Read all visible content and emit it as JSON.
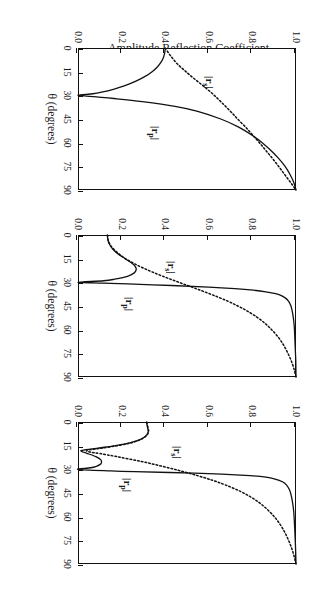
{
  "figure": {
    "yaxis_label": "Amplitude Reflection Coefficient",
    "xaxis_label": "θ (degrees)",
    "rp_label": "|r",
    "rp_sub": "p",
    "rp_label_end": "|",
    "rs_label": "|r",
    "rs_sub": "s",
    "rs_label_end": "|"
  },
  "axes": {
    "x_ticks": [
      "0",
      "15",
      "30",
      "45",
      "60",
      "75",
      "90"
    ],
    "y_ticks": [
      "0.0",
      "0.2",
      "0.4",
      "0.6",
      "0.8",
      "1.0"
    ]
  },
  "panels": [
    {
      "id": "a",
      "label": "(a)  Air Gap = 100 nm",
      "gap_nm": 100
    },
    {
      "id": "b",
      "label": "(b)  Air Gap = 300 nm",
      "gap_nm": 300
    },
    {
      "id": "c",
      "label": "(c)  Air Gap = 400 nm",
      "gap_nm": 400
    }
  ],
  "chart_data": {
    "type": "line",
    "title": "",
    "xlabel": "θ (degrees)",
    "ylabel": "Amplitude Reflection Coefficient",
    "xlim": [
      0,
      90
    ],
    "ylim": [
      0.0,
      1.0
    ],
    "xticks": [
      0,
      15,
      30,
      45,
      60,
      75,
      90
    ],
    "yticks": [
      0.0,
      0.2,
      0.4,
      0.6,
      0.8,
      1.0
    ],
    "grid": false,
    "legend": "inline-annotations",
    "panels": [
      {
        "panel": "a",
        "annotation": "(a)  Air Gap = 100 nm",
        "series": [
          {
            "name": "|r_p|",
            "style": "solid",
            "x": [
              0,
              3,
              6,
              9,
              12,
              15,
              18,
              21,
              24,
              26,
              28,
              29,
              30,
              31,
              32,
              34,
              37,
              40,
              45,
              50,
              55,
              60,
              65,
              70,
              75,
              80,
              85,
              90
            ],
            "values": [
              0.4,
              0.398,
              0.392,
              0.381,
              0.364,
              0.34,
              0.308,
              0.266,
              0.212,
              0.166,
              0.108,
              0.068,
              0.0,
              0.085,
              0.165,
              0.295,
              0.445,
              0.545,
              0.655,
              0.735,
              0.795,
              0.845,
              0.885,
              0.92,
              0.95,
              0.972,
              0.989,
              1.0
            ]
          },
          {
            "name": "|r_s|",
            "style": "dotted",
            "x": [
              0,
              5,
              10,
              14,
              18,
              22,
              26,
              30,
              34,
              38,
              42,
              45,
              50,
              55,
              60,
              65,
              70,
              75,
              80,
              85,
              90
            ],
            "values": [
              0.4,
              0.425,
              0.455,
              0.487,
              0.52,
              0.556,
              0.592,
              0.625,
              0.655,
              0.684,
              0.712,
              0.732,
              0.768,
              0.8,
              0.832,
              0.862,
              0.892,
              0.92,
              0.947,
              0.974,
              1.0
            ]
          }
        ]
      },
      {
        "panel": "b",
        "annotation": "(b)  Air Gap = 300 nm",
        "series": [
          {
            "name": "|r_p|",
            "style": "solid",
            "x": [
              0,
              3,
              6,
              9,
              12,
              15,
              18,
              20,
              22,
              24,
              26,
              28,
              29,
              30,
              30.5,
              31,
              32,
              33,
              34,
              35,
              36,
              37,
              38,
              40,
              42,
              44,
              46,
              50,
              55,
              60,
              70,
              80,
              90
            ],
            "values": [
              0.135,
              0.137,
              0.145,
              0.16,
              0.184,
              0.216,
              0.249,
              0.263,
              0.267,
              0.258,
              0.23,
              0.168,
              0.118,
              0.0,
              0.115,
              0.228,
              0.43,
              0.6,
              0.72,
              0.805,
              0.862,
              0.9,
              0.925,
              0.952,
              0.966,
              0.974,
              0.979,
              0.985,
              0.99,
              0.993,
              0.996,
              0.999,
              1.0
            ]
          },
          {
            "name": "|r_s|",
            "style": "dotted",
            "x": [
              0,
              4,
              8,
              12,
              15,
              18,
              21,
              24,
              27,
              30,
              33,
              36,
              39,
              42,
              45,
              48,
              52,
              56,
              60,
              65,
              70,
              75,
              80,
              85,
              90
            ],
            "values": [
              0.135,
              0.14,
              0.157,
              0.188,
              0.218,
              0.256,
              0.3,
              0.35,
              0.405,
              0.463,
              0.522,
              0.58,
              0.636,
              0.688,
              0.733,
              0.774,
              0.82,
              0.858,
              0.888,
              0.92,
              0.944,
              0.963,
              0.979,
              0.991,
              1.0
            ]
          }
        ]
      },
      {
        "panel": "c",
        "annotation": "(c)  Air Gap = 400 nm",
        "series": [
          {
            "name": "|r_p|",
            "style": "solid",
            "x": [
              0,
              2,
              4,
              6,
              8,
              10,
              12,
              14,
              16,
              17,
              18,
              19,
              20,
              22,
              24,
              26,
              27,
              28,
              29,
              30,
              31,
              31.5,
              32,
              33,
              34,
              35,
              36,
              38,
              40,
              43,
              46,
              50,
              56,
              62,
              70,
              80,
              90
            ],
            "values": [
              0.315,
              0.317,
              0.32,
              0.322,
              0.316,
              0.3,
              0.268,
              0.212,
              0.122,
              0.066,
              0.016,
              0.022,
              0.044,
              0.082,
              0.105,
              0.107,
              0.1,
              0.086,
              0.058,
              0.0,
              0.15,
              0.26,
              0.42,
              0.66,
              0.79,
              0.862,
              0.9,
              0.94,
              0.957,
              0.97,
              0.977,
              0.983,
              0.989,
              0.992,
              0.995,
              0.998,
              1.0
            ]
          },
          {
            "name": "|r_s|",
            "style": "dotted",
            "x": [
              0,
              2,
              4,
              6,
              8,
              10,
              12,
              14,
              16,
              17,
              18,
              19,
              20,
              22,
              25,
              28,
              31,
              34,
              37,
              40,
              44,
              48,
              52,
              57,
              62,
              68,
              75,
              82,
              90
            ],
            "values": [
              0.315,
              0.318,
              0.322,
              0.324,
              0.318,
              0.302,
              0.272,
              0.22,
              0.138,
              0.088,
              0.04,
              0.055,
              0.1,
              0.18,
              0.29,
              0.385,
              0.47,
              0.548,
              0.618,
              0.678,
              0.745,
              0.798,
              0.84,
              0.88,
              0.912,
              0.941,
              0.966,
              0.985,
              1.0
            ]
          }
        ]
      }
    ]
  }
}
